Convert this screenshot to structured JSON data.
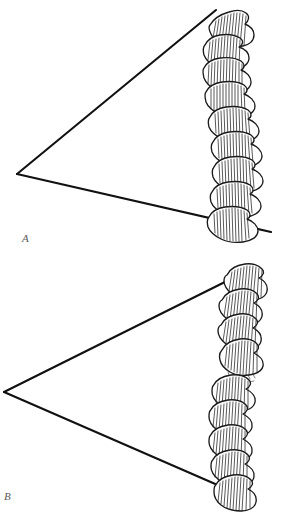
{
  "figure": {
    "style": "hand-drawn pen-and-ink line illustration",
    "background_color": "#ffffff",
    "ink_color": "#1a1a1a",
    "label_color": "#5a5a5a",
    "width": 308,
    "height": 514
  },
  "panels": [
    {
      "id": "A",
      "label": "A",
      "label_position": {
        "x": 22,
        "y": 232
      },
      "description": "Wedge angle with continuous curved vertebral column",
      "apex": {
        "x": 17,
        "y": 174
      },
      "upper_ray_end": {
        "x": 216,
        "y": 10
      },
      "lower_ray_end": {
        "x": 271,
        "y": 232
      },
      "spine_continuous": true,
      "vertebra_count": 9
    },
    {
      "id": "B",
      "label": "B",
      "label_position": {
        "x": 4,
        "y": 490
      },
      "description": "Wedge angle with interrupted (offset) vertebral column",
      "apex": {
        "x": 4,
        "y": 392
      },
      "upper_ray_end": {
        "x": 253,
        "y": 268
      },
      "lower_ray_end": {
        "x": 252,
        "y": 500
      },
      "spine_continuous": false,
      "vertebra_count": 9,
      "break_position": {
        "x": 232,
        "y": 378
      }
    }
  ],
  "icons": {
    "panel_a_label": "letter-a-label",
    "panel_b_label": "letter-b-label"
  }
}
